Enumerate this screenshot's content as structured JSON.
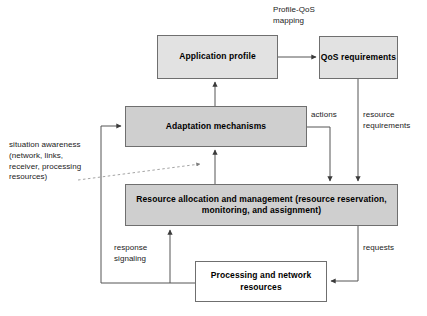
{
  "diagram": {
    "canvas": {
      "width": 427,
      "height": 316,
      "background": "#ffffff"
    },
    "colors": {
      "box_fill_light": "#e2e2e2",
      "box_fill_dark": "#cfcfcf",
      "box_fill_white": "#ffffff",
      "box_border": "#6f6f6f",
      "line": "#555555",
      "dashed_line": "#9a9a9a",
      "text": "#000000"
    },
    "nodes": {
      "application_profile": {
        "label": "Application profile",
        "fill": "#e2e2e2",
        "x": 157,
        "y": 35,
        "w": 121,
        "h": 44
      },
      "qos_requirements": {
        "label": "QoS\nrequirements",
        "fill": "#e2e2e2",
        "x": 319,
        "y": 36,
        "w": 79,
        "h": 43
      },
      "adaptation_mechanisms": {
        "label": "Adaptation mechanisms",
        "fill": "#cfcfcf",
        "x": 125,
        "y": 106,
        "w": 182,
        "h": 41
      },
      "resource_allocation": {
        "label": "Resource allocation and management\n(resource reservation, monitoring, and assignment)",
        "fill": "#cfcfcf",
        "x": 125,
        "y": 184,
        "w": 273,
        "h": 42
      },
      "processing_resources": {
        "label": "Processing and network\nresources",
        "fill": "#ffffff",
        "x": 195,
        "y": 261,
        "w": 132,
        "h": 41
      }
    },
    "edge_labels": {
      "profile_qos_mapping": {
        "text": "Profile-QoS\nmapping",
        "x": 273,
        "y": 5
      },
      "actions": {
        "text": "actions",
        "x": 311,
        "y": 110
      },
      "resource_requirements": {
        "text": "resource\nrequirements",
        "x": 363,
        "y": 110
      },
      "response_signaling": {
        "text": "response\nsignaling",
        "x": 114,
        "y": 243
      },
      "requests": {
        "text": "requests",
        "x": 363,
        "y": 243
      }
    },
    "notes": {
      "situation_awareness": {
        "text": "situation awareness\n(network, links,\nreceiver, processing\nresources)",
        "x": 9,
        "y": 140
      }
    },
    "edges": [
      {
        "name": "application-profile-to-qos-requirements",
        "from": "application_profile",
        "to": "qos_requirements",
        "label": "Profile-QoS mapping",
        "style": "solid"
      },
      {
        "name": "qos-requirements-to-resource-allocation",
        "from": "qos_requirements",
        "to": "resource_allocation",
        "label": "resource requirements",
        "style": "solid"
      },
      {
        "name": "adaptation-to-application-profile",
        "from": "adaptation_mechanisms",
        "to": "application_profile",
        "label": "",
        "style": "solid"
      },
      {
        "name": "adaptation-to-resource-allocation",
        "from": "adaptation_mechanisms",
        "to": "resource_allocation",
        "label": "actions",
        "style": "solid"
      },
      {
        "name": "resource-allocation-to-adaptation",
        "from": "resource_allocation",
        "to": "adaptation_mechanisms",
        "label": "",
        "style": "solid"
      },
      {
        "name": "resource-allocation-to-processing",
        "from": "resource_allocation",
        "to": "processing_resources",
        "label": "requests",
        "style": "solid"
      },
      {
        "name": "processing-to-resource-allocation",
        "from": "processing_resources",
        "to": "resource_allocation",
        "label": "response signaling",
        "style": "solid"
      },
      {
        "name": "processing-to-adaptation-feedback",
        "from": "processing_resources",
        "to": "adaptation_mechanisms",
        "label": "",
        "style": "solid"
      },
      {
        "name": "situation-awareness-annotation",
        "from": "situation_awareness",
        "to": "resource_allocation",
        "label": "situation awareness",
        "style": "dashed"
      }
    ]
  }
}
